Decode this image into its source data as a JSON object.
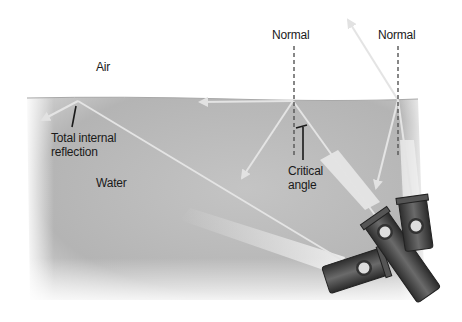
{
  "diagram": {
    "labels": {
      "air": "Air",
      "water": "Water",
      "normal_left": "Normal",
      "normal_right": "Normal",
      "total_internal_reflection_line1": "Total internal",
      "total_internal_reflection_line2": "reflection",
      "critical_angle_line1": "Critical",
      "critical_angle_line2": "angle"
    },
    "colors": {
      "water": "#b9b9b9",
      "air": "#ffffff",
      "beam": "#e6e6e6",
      "flashlight": "#4a4a4a",
      "text": "#1a1a1a"
    },
    "rays": [
      {
        "name": "shallow-beam",
        "behavior": "total internal reflection"
      },
      {
        "name": "critical-beam",
        "behavior": "refracted along surface at critical angle"
      },
      {
        "name": "steep-beam",
        "behavior": "refracted into air"
      }
    ]
  }
}
